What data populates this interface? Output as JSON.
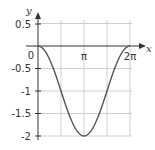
{
  "chart_data": {
    "type": "line",
    "title": "",
    "function": "y = cos(x) - 1",
    "xlabel": "x",
    "ylabel": "y",
    "xlim": [
      0,
      6.2832
    ],
    "ylim": [
      -2,
      0.5
    ],
    "grid": true,
    "x_ticks": [
      {
        "value": 0,
        "label": "0"
      },
      {
        "value": 3.1416,
        "label": "π"
      },
      {
        "value": 6.2832,
        "label": "2π"
      }
    ],
    "y_ticks": [
      {
        "value": 0.5,
        "label": "0.5"
      },
      {
        "value": -0.5,
        "label": "-0.5"
      },
      {
        "value": -1,
        "label": "-1"
      },
      {
        "value": -1.5,
        "label": "-1.5"
      },
      {
        "value": -2,
        "label": "-2"
      }
    ],
    "series": [
      {
        "name": "cos(x) - 1",
        "color": "#555555",
        "x": [
          0,
          0.7854,
          1.5708,
          2.3562,
          3.1416,
          3.927,
          4.7124,
          5.4978,
          6.2832
        ],
        "y": [
          -2,
          -1.707,
          -1,
          -0.293,
          0,
          -0.293,
          -1,
          -1.707,
          -2
        ]
      }
    ]
  },
  "labels": {
    "x_axis": "x",
    "y_axis": "y",
    "origin": "0",
    "pi": "π",
    "two_pi": "2π",
    "y_05": "0.5",
    "y_m05": "-0.5",
    "y_m1": "-1",
    "y_m15": "-1.5",
    "y_m2": "-2"
  },
  "colors": {
    "grid": "#d0d0d0",
    "axis": "#333333",
    "curve": "#555555"
  }
}
